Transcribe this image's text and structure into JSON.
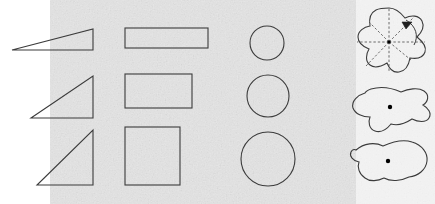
{
  "figure": {
    "background_color": "#ffffff",
    "paper_tint_color": "#ebebeb",
    "stroke_color": "#3b3b3b",
    "dashed_color": "#4a4a4a",
    "dot_color": "#000000",
    "width": 435,
    "height": 204,
    "paper_region": {
      "x": 50,
      "y": 0,
      "width": 385,
      "height": 204
    }
  },
  "columns": [
    {
      "name": "triangles",
      "label": "Right triangles",
      "items": [
        {
          "name": "triangle-flat",
          "points": "12,50 93,50 93,29",
          "label": "flat right triangle"
        },
        {
          "name": "triangle-medium",
          "points": "31,118 93,118 93,76",
          "label": "medium right triangle"
        },
        {
          "name": "triangle-tall",
          "points": "37,185 93,185 93,130",
          "label": "tall right triangle"
        }
      ]
    },
    {
      "name": "rectangles",
      "label": "Rectangles",
      "items": [
        {
          "name": "rectangle-wide",
          "x": 125,
          "y": 28,
          "width": 83,
          "height": 20,
          "label": "wide thin rectangle"
        },
        {
          "name": "rectangle-medium",
          "x": 125,
          "y": 74,
          "width": 67,
          "height": 34,
          "label": "medium rectangle"
        },
        {
          "name": "rectangle-square",
          "x": 125,
          "y": 127,
          "width": 55,
          "height": 58,
          "label": "square"
        }
      ]
    },
    {
      "name": "circles",
      "label": "Circles",
      "items": [
        {
          "name": "circle-small",
          "cx": 267,
          "cy": 43,
          "r": 17,
          "label": "small circle"
        },
        {
          "name": "circle-medium",
          "cx": 268,
          "cy": 96,
          "r": 21,
          "label": "medium circle"
        },
        {
          "name": "circle-large",
          "cx": 268,
          "cy": 159,
          "r": 27,
          "label": "large circle"
        }
      ]
    },
    {
      "name": "blobs",
      "label": "Irregular blobs",
      "items": [
        {
          "name": "blob-rotational-symmetry",
          "label": "five-lobed blob with rotational symmetry axes",
          "center": {
            "cx": 389,
            "cy": 42
          },
          "path": "M389,8 C396,8 401,13 405,18 C411,15 419,15 422,21 C425,27 421,33 417,37 C422,41 427,46 425,52 C423,58 416,59 410,58 C409,64 406,71 399,72 C393,73 389,68 387,63 C382,66 375,69 370,65 C365,61 366,54 369,49 C364,47 358,43 358,37 C358,31 364,27 370,26 C369,20 370,13 376,10 C380,8 385,8 389,8 Z",
          "radials": [
            {
              "x1": 389,
              "y1": 42,
              "x2": 389,
              "y2": 8
            },
            {
              "x1": 389,
              "y1": 42,
              "x2": 389,
              "y2": 72
            },
            {
              "x1": 389,
              "y1": 42,
              "x2": 357,
              "y2": 42
            },
            {
              "x1": 389,
              "y1": 42,
              "x2": 425,
              "y2": 42
            },
            {
              "x1": 389,
              "y1": 42,
              "x2": 414,
              "y2": 17
            },
            {
              "x1": 389,
              "y1": 42,
              "x2": 366,
              "y2": 66
            },
            {
              "x1": 389,
              "y1": 42,
              "x2": 411,
              "y2": 60
            },
            {
              "x1": 389,
              "y1": 42,
              "x2": 369,
              "y2": 22
            }
          ],
          "rotation_arrow": {
            "name": "rotation-arrow",
            "arc_path": "M406,20 C416,26 419,36 414,45",
            "arrow_head": "402,22 412,22 406,29"
          },
          "center_dot": {
            "cx": 389,
            "cy": 42,
            "r": 1.8
          }
        },
        {
          "name": "blob-amoeba",
          "label": "amoeba blob with centre dot",
          "center": {
            "cx": 390,
            "cy": 107
          },
          "path": "M371,89 C381,86 392,88 401,92 C408,89 418,87 424,91 C430,95 428,102 423,105 C428,108 432,113 429,118 C426,123 418,122 412,119 C406,123 398,126 391,124 C387,129 381,133 375,131 C369,129 368,122 370,117 C363,117 355,114 353,108 C351,101 358,95 365,93 C366,91 368,90 371,89 Z",
          "center_dot": {
            "cx": 390,
            "cy": 107,
            "r": 2.2
          }
        },
        {
          "name": "blob-peanut",
          "label": "peanut blob with centre dot",
          "center": {
            "cx": 388,
            "cy": 161
          },
          "path": "M356,150 C364,143 375,142 383,146 C392,142 403,139 412,142 C422,145 428,153 427,161 C426,170 418,176 409,177 C401,181 391,182 384,178 C378,181 370,182 365,178 C359,174 357,167 359,162 C353,161 349,156 351,152 C352,150 354,149 356,150 Z",
          "center_dot": {
            "cx": 388,
            "cy": 161,
            "r": 2.2
          }
        }
      ]
    }
  ]
}
